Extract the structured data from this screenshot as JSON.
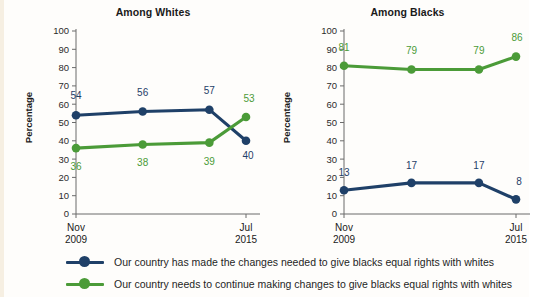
{
  "chart_data": {
    "type": "line",
    "title": "",
    "panels": [
      {
        "id": "whites",
        "title": "Among Whites",
        "ylabel": "Percentage",
        "ylim": [
          0,
          100
        ],
        "yticks": [
          0,
          10,
          20,
          30,
          40,
          50,
          60,
          70,
          80,
          90,
          100
        ],
        "ytick_labels": [
          "0",
          "10",
          "20",
          "30",
          "40",
          "50",
          "60",
          "70",
          "80",
          "90",
          "100"
        ],
        "x": [
          0,
          1,
          2,
          2.55
        ],
        "xtick_positions": [
          0,
          2.55
        ],
        "xtick_labels": [
          [
            "Nov",
            "2009"
          ],
          [
            "Jul",
            "2015"
          ]
        ],
        "grid": false,
        "series": [
          {
            "name": "Our country has made the changes needed to give blacks equal rights with whites",
            "color": "#1f4068",
            "values": [
              54,
              56,
              57,
              40
            ],
            "labels": [
              "54",
              "56",
              "57",
              "40"
            ],
            "label_positions": [
              "above",
              "above",
              "above",
              "below"
            ]
          },
          {
            "name": "Our country needs to continue making changes to give blacks equal rights with whites",
            "color": "#4b9b38",
            "values": [
              36,
              38,
              39,
              53
            ],
            "labels": [
              "36",
              "38",
              "39",
              "53"
            ],
            "label_positions": [
              "below",
              "below",
              "below",
              "above"
            ]
          }
        ]
      },
      {
        "id": "blacks",
        "title": "Among Blacks",
        "ylabel": "Percentage",
        "ylim": [
          0,
          100
        ],
        "yticks": [
          0,
          10,
          20,
          30,
          40,
          50,
          60,
          70,
          80,
          90,
          100
        ],
        "ytick_labels": [
          "0",
          "10",
          "20",
          "30",
          "40",
          "50",
          "60",
          "70",
          "80",
          "90",
          "100"
        ],
        "x": [
          0,
          1,
          2,
          2.55
        ],
        "xtick_positions": [
          0,
          2.55
        ],
        "xtick_labels": [
          [
            "Nov",
            "2009"
          ],
          [
            "Jul",
            "2015"
          ]
        ],
        "grid": false,
        "series": [
          {
            "name": "Our country has made the changes needed to give blacks equal rights with whites",
            "color": "#1f4068",
            "values": [
              13,
              17,
              17,
              8
            ],
            "labels": [
              "13",
              "17",
              "17",
              "8"
            ],
            "label_positions": [
              "above",
              "above",
              "above",
              "above"
            ]
          },
          {
            "name": "Our country needs to continue making changes to give blacks equal rights with whites",
            "color": "#4b9b38",
            "values": [
              81,
              79,
              79,
              86
            ],
            "labels": [
              "81",
              "79",
              "79",
              "86"
            ],
            "label_positions": [
              "above",
              "above",
              "above",
              "above"
            ]
          }
        ]
      }
    ]
  },
  "panel_whites": {
    "title": "Among Whites",
    "ylabel": "Percentage",
    "xlabel_left_line1": "Nov",
    "xlabel_left_line2": "2009",
    "xlabel_right_line1": "Jul",
    "xlabel_right_line2": "2015"
  },
  "panel_blacks": {
    "title": "Among Blacks",
    "ylabel": "Percentage",
    "xlabel_left_line1": "Nov",
    "xlabel_left_line2": "2009",
    "xlabel_right_line1": "Jul",
    "xlabel_right_line2": "2015"
  },
  "legend": {
    "items": [
      {
        "label": "Our country has made the changes needed to give blacks equal rights with whites",
        "color": "#1f4068"
      },
      {
        "label": "Our country needs to continue making changes to give blacks equal rights with whites",
        "color": "#4b9b38"
      }
    ]
  },
  "colors": {
    "blue": "#1f4068",
    "green": "#4b9b38",
    "axis": "#6b6b6b",
    "text": "#1a1a1a",
    "background": "#fefdfb"
  }
}
